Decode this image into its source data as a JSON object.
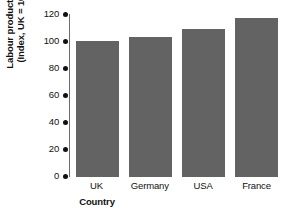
{
  "chart_data": {
    "type": "bar",
    "title": "",
    "xlabel": "Country",
    "ylabel_line1": "Labour productivity",
    "ylabel_line2": "(Index, UK = 100)",
    "categories": [
      "UK",
      "Germany",
      "USA",
      "France"
    ],
    "values": [
      100,
      103,
      109,
      117
    ],
    "ylim": [
      0,
      120
    ],
    "ytick_labels": [
      "120",
      "100",
      "80",
      "60",
      "40",
      "20",
      "0"
    ],
    "ytick_values": [
      120,
      100,
      80,
      60,
      40,
      20,
      0
    ],
    "grid": false,
    "legend": "none",
    "bar_color": "#636363",
    "axis_color": "#6d6d6d",
    "text_color": "#111111",
    "tick_marker_style": "filled-circle"
  }
}
